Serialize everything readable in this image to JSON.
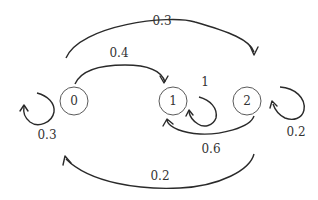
{
  "diagram": {
    "type": "markov-chain-state-diagram",
    "nodes": [
      {
        "id": "0",
        "label": "0"
      },
      {
        "id": "1",
        "label": "1"
      },
      {
        "id": "2",
        "label": "2"
      }
    ],
    "edges": [
      {
        "from": "0",
        "to": "0",
        "label": "0.3"
      },
      {
        "from": "0",
        "to": "1",
        "label": "0.4"
      },
      {
        "from": "0",
        "to": "2",
        "label": "0.3"
      },
      {
        "from": "1",
        "to": "1",
        "label": "1"
      },
      {
        "from": "2",
        "to": "1",
        "label": "0.6"
      },
      {
        "from": "2",
        "to": "2",
        "label": "0.2"
      },
      {
        "from": "2",
        "to": "0",
        "label": "0.2"
      }
    ]
  }
}
